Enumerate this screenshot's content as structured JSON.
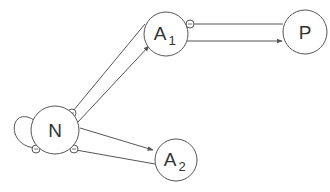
{
  "diagram": {
    "nodes": [
      {
        "id": "N",
        "label": "N",
        "subscript": ""
      },
      {
        "id": "A1",
        "label": "A",
        "subscript": "1"
      },
      {
        "id": "A2",
        "label": "A",
        "subscript": "2"
      },
      {
        "id": "P",
        "label": "P",
        "subscript": ""
      }
    ],
    "edges": [
      {
        "from": "N",
        "to": "A1",
        "type": "activation"
      },
      {
        "from": "A1",
        "to": "N",
        "type": "inhibition"
      },
      {
        "from": "N",
        "to": "A2",
        "type": "activation"
      },
      {
        "from": "A2",
        "to": "N",
        "type": "inhibition"
      },
      {
        "from": "A1",
        "to": "P",
        "type": "activation"
      },
      {
        "from": "P",
        "to": "A1",
        "type": "inhibition"
      },
      {
        "from": "N",
        "to": "N",
        "type": "inhibition",
        "self_loop": true
      }
    ],
    "colors": {
      "stroke": "#555555",
      "text": "#333333",
      "background": "#ffffff"
    }
  }
}
